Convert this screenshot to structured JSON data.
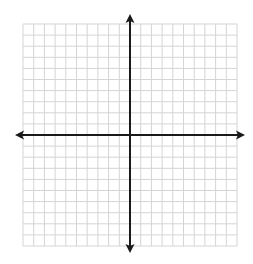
{
  "diagram": {
    "type": "coordinate-plane",
    "grid": {
      "columns": 20,
      "rows": 20,
      "left": 23,
      "top": 24,
      "right": 237,
      "bottom": 246,
      "line_color": "#d4d4d4"
    },
    "axes": {
      "color": "#1a1a1a",
      "x_axis_y": 135,
      "y_axis_x": 130,
      "x_start": 15,
      "x_end": 245,
      "y_start": 14,
      "y_end": 253
    },
    "labels": []
  }
}
